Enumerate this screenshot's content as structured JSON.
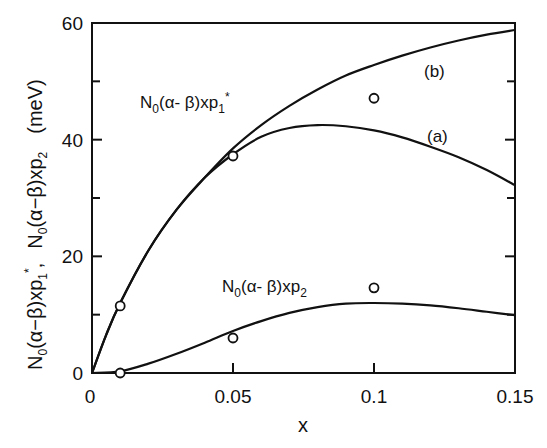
{
  "chart_data": {
    "type": "line",
    "title": "",
    "xlabel": "x",
    "ylabel": "N0(α−β)xp1*,  N0(α−β)xp2   (meV)",
    "xlim": [
      0,
      0.15
    ],
    "ylim": [
      0,
      60
    ],
    "grid": false,
    "x_ticks": [
      0,
      0.05,
      0.1,
      0.15
    ],
    "x_tick_labels": [
      "0",
      "0.05",
      "0.1",
      "0.15"
    ],
    "y_ticks": [
      0,
      20,
      40,
      60
    ],
    "y_tick_labels": [
      "0",
      "20",
      "40",
      "60"
    ],
    "y_minor_ticks": [
      10,
      30,
      50
    ],
    "series": [
      {
        "name": "(b)",
        "kind": "line",
        "group": "N0(α-β)xp1*",
        "x": [
          0,
          0.005,
          0.01,
          0.02,
          0.03,
          0.04,
          0.05,
          0.06,
          0.07,
          0.08,
          0.09,
          0.1,
          0.11,
          0.12,
          0.13,
          0.14,
          0.15
        ],
        "values": [
          0,
          6.5,
          12,
          21,
          28,
          33.5,
          38.5,
          42.5,
          45.8,
          48.6,
          51,
          52.8,
          54.4,
          55.8,
          57,
          58,
          58.8
        ]
      },
      {
        "name": "(a)",
        "kind": "line",
        "group": "N0(α-β)xp1*",
        "x": [
          0,
          0.005,
          0.01,
          0.02,
          0.03,
          0.04,
          0.05,
          0.06,
          0.07,
          0.08,
          0.09,
          0.1,
          0.11,
          0.12,
          0.13,
          0.14,
          0.15
        ],
        "values": [
          0,
          6.5,
          12,
          21,
          28,
          33.5,
          37.5,
          40.5,
          42,
          42.5,
          42.3,
          41.6,
          40.4,
          38.8,
          37,
          34.8,
          32.2
        ]
      },
      {
        "name": "N0(α-β)xp2",
        "kind": "line",
        "x": [
          0,
          0.01,
          0.02,
          0.03,
          0.04,
          0.05,
          0.06,
          0.07,
          0.08,
          0.09,
          0.1,
          0.11,
          0.12,
          0.13,
          0.14,
          0.15
        ],
        "values": [
          0,
          0.3,
          1.6,
          3.3,
          5.2,
          7.2,
          8.9,
          10.3,
          11.3,
          11.9,
          12.0,
          11.9,
          11.6,
          11.1,
          10.5,
          9.9
        ]
      },
      {
        "name": "data xp1*",
        "kind": "scatter",
        "marker": "open-circle",
        "x": [
          0.01,
          0.05,
          0.1
        ],
        "values": [
          11.5,
          37.2,
          47.1
        ]
      },
      {
        "name": "data xp2",
        "kind": "scatter",
        "marker": "open-circle",
        "x": [
          0.01,
          0.05,
          0.1
        ],
        "values": [
          0,
          6.0,
          14.6
        ]
      }
    ],
    "annotations": [
      {
        "text": "N0(α-β)xp1*",
        "x": 0.018,
        "y": 50
      },
      {
        "text": "(b)",
        "x": 0.128,
        "y": 52
      },
      {
        "text": "(a)",
        "x": 0.128,
        "y": 40.5
      },
      {
        "text": "N0(α-β)xp2",
        "x": 0.046,
        "y": 15
      }
    ]
  },
  "labels": {
    "xlabel": "x",
    "ylabel_p1_main": "N",
    "ylabel_p1_sub0": "0",
    "ylabel_p1_rest": "(α−β)xp",
    "ylabel_p1_sub1": "1",
    "ylabel_p1_star": "*",
    "ylabel_sep": ",",
    "ylabel_p2_main": "N",
    "ylabel_p2_sub0": "0",
    "ylabel_p2_rest": "(α−β)xp",
    "ylabel_p2_sub2": "2",
    "ylabel_unit": "(meV)",
    "ann_p1_main": "N",
    "ann_p1_sub0": "0",
    "ann_p1_rest": "(α- β)xp",
    "ann_p1_sub1": "1",
    "ann_p1_star": "*",
    "ann_b": "(b)",
    "ann_a": "(a)",
    "ann_p2_main": "N",
    "ann_p2_sub0": "0",
    "ann_p2_rest": "(α- β)xp",
    "ann_p2_sub2": "2"
  }
}
